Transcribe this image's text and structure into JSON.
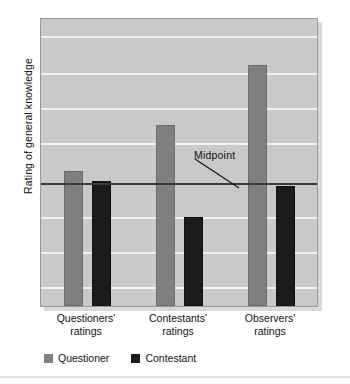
{
  "chart_data": {
    "type": "bar",
    "title": "",
    "xlabel": "",
    "ylabel": "Rating of general knowledge",
    "categories": [
      "Questioners' ratings",
      "Contestants' ratings",
      "Observers' ratings"
    ],
    "category_lines": [
      [
        "Questioners'",
        "ratings"
      ],
      [
        "Contestants'",
        "ratings"
      ],
      [
        "Observers'",
        "ratings"
      ]
    ],
    "series": [
      {
        "name": "Questioner",
        "color": "#7f7f7f",
        "values": [
          0.12,
          0.57,
          1.15
        ]
      },
      {
        "name": "Contestant",
        "color": "#1b1b1b",
        "values": [
          0.02,
          -0.33,
          -0.03
        ]
      }
    ],
    "ylim": [
      -1.2,
      1.6
    ],
    "grid": true,
    "gridlines_y": [
      1.42,
      1.06,
      0.72,
      0.38,
      -0.34,
      -0.68,
      -1.02
    ],
    "reference_line": {
      "label": "Midpoint",
      "value": 0,
      "color": "#3a3a3a"
    },
    "annotations": [
      {
        "text": "Midpoint",
        "target": "reference-line",
        "leader": true
      }
    ],
    "legend": {
      "position": "bottom-left",
      "entries": [
        "Questioner",
        "Contestant"
      ]
    },
    "plot_background": "#c9c9c9",
    "gridline_color": "#f2f2f2",
    "axis_tick_labels": []
  },
  "legend": {
    "items": [
      {
        "label": "Questioner",
        "color": "#7f7f7f"
      },
      {
        "label": "Contestant",
        "color": "#1b1b1b"
      }
    ]
  },
  "axis": {
    "y_title": "Rating of general knowledge"
  },
  "annotation": {
    "midpoint_label": "Midpoint"
  }
}
